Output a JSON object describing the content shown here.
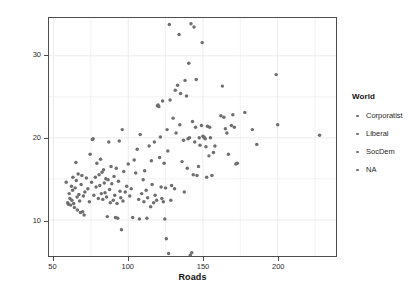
{
  "chart_data": {
    "type": "scatter",
    "title": "",
    "xlabel": "Roads",
    "ylabel": "Donors",
    "xlim": [
      47,
      239
    ],
    "ylim": [
      5.6,
      34.6
    ],
    "xticks": [
      50,
      100,
      150,
      200
    ],
    "yticks": [
      10,
      20,
      30
    ],
    "grid": true,
    "grid_color": "#eaeaea",
    "point_color": "#6e6e6e",
    "point_size": 2.6,
    "legend": {
      "position": "right",
      "title": "World",
      "entries": [
        {
          "label": "Corporatist",
          "marker": "circle",
          "color": "#6e6e6e"
        },
        {
          "label": "Liberal",
          "marker": "circle",
          "color": "#6e6e6e"
        },
        {
          "label": "SocDem",
          "marker": "circle",
          "color": "#6e6e6e"
        },
        {
          "label": "NA",
          "marker": "circle",
          "color": "#6e6e6e"
        }
      ]
    },
    "series": [
      {
        "name": "observations",
        "color": "#6e6e6e",
        "points": [
          [
            58.5,
            14.6
          ],
          [
            59.5,
            12.1
          ],
          [
            60.0,
            11.9
          ],
          [
            60.5,
            13.2
          ],
          [
            61.0,
            12.6
          ],
          [
            61.5,
            11.8
          ],
          [
            62.0,
            14.1
          ],
          [
            62.3,
            12.4
          ],
          [
            62.8,
            13.6
          ],
          [
            63.0,
            15.2
          ],
          [
            63.5,
            12.0
          ],
          [
            64.0,
            11.5
          ],
          [
            64.5,
            13.9
          ],
          [
            65.0,
            17.0
          ],
          [
            65.3,
            14.8
          ],
          [
            65.8,
            12.8
          ],
          [
            66.0,
            11.2
          ],
          [
            66.5,
            15.6
          ],
          [
            67.0,
            13.1
          ],
          [
            67.5,
            12.3
          ],
          [
            68.0,
            10.9
          ],
          [
            68.5,
            14.3
          ],
          [
            69.0,
            15.4
          ],
          [
            69.5,
            11.0
          ],
          [
            70.0,
            12.9
          ],
          [
            70.5,
            10.6
          ],
          [
            71.0,
            13.4
          ],
          [
            72.0,
            15.1
          ],
          [
            73.0,
            13.8
          ],
          [
            74.0,
            12.2
          ],
          [
            74.5,
            18.0
          ],
          [
            75.5,
            14.6
          ],
          [
            76.0,
            19.8
          ],
          [
            76.5,
            19.9
          ],
          [
            77.0,
            13.0
          ],
          [
            78.0,
            15.2
          ],
          [
            78.5,
            14.0
          ],
          [
            79.0,
            16.9
          ],
          [
            80.0,
            12.6
          ],
          [
            80.5,
            15.5
          ],
          [
            81.0,
            14.2
          ],
          [
            81.5,
            17.4
          ],
          [
            82.0,
            13.2
          ],
          [
            82.5,
            15.8
          ],
          [
            83.0,
            12.5
          ],
          [
            83.5,
            16.1
          ],
          [
            84.0,
            14.5
          ],
          [
            84.5,
            13.3
          ],
          [
            85.0,
            15.0
          ],
          [
            85.5,
            12.8
          ],
          [
            86.0,
            10.4
          ],
          [
            86.5,
            14.9
          ],
          [
            87.0,
            19.5
          ],
          [
            87.5,
            13.7
          ],
          [
            88.0,
            12.1
          ],
          [
            88.5,
            16.5
          ],
          [
            89.0,
            14.4
          ],
          [
            90.0,
            12.4
          ],
          [
            90.5,
            15.3
          ],
          [
            91.0,
            13.0
          ],
          [
            91.5,
            10.3
          ],
          [
            92.0,
            16.3
          ],
          [
            92.5,
            12.0
          ],
          [
            93.0,
            10.2
          ],
          [
            93.5,
            14.7
          ],
          [
            94.0,
            19.6
          ],
          [
            94.5,
            13.5
          ],
          [
            95.0,
            12.7
          ],
          [
            95.5,
            8.8
          ],
          [
            96.0,
            21.0
          ],
          [
            96.5,
            12.3
          ],
          [
            97.0,
            15.9
          ],
          [
            98.0,
            13.4
          ],
          [
            99.0,
            14.1
          ],
          [
            100.0,
            16.8
          ],
          [
            101.0,
            12.9
          ],
          [
            102.0,
            13.8
          ],
          [
            103.0,
            10.3
          ],
          [
            104.0,
            17.3
          ],
          [
            105.0,
            15.7
          ],
          [
            106.0,
            18.6
          ],
          [
            107.0,
            12.5
          ],
          [
            107.5,
            10.1
          ],
          [
            108.0,
            20.4
          ],
          [
            109.0,
            13.2
          ],
          [
            110.0,
            14.9
          ],
          [
            110.5,
            12.2
          ],
          [
            111.0,
            16.0
          ],
          [
            112.0,
            13.6
          ],
          [
            112.5,
            10.2
          ],
          [
            113.0,
            12.7
          ],
          [
            114.0,
            19.0
          ],
          [
            115.0,
            11.6
          ],
          [
            115.5,
            17.2
          ],
          [
            116.0,
            14.3
          ],
          [
            117.0,
            12.1
          ],
          [
            117.5,
            19.5
          ],
          [
            118.0,
            13.0
          ],
          [
            119.0,
            12.4
          ],
          [
            119.5,
            23.9
          ],
          [
            120.0,
            24.0
          ],
          [
            120.5,
            23.8
          ],
          [
            121.0,
            17.6
          ],
          [
            121.5,
            20.1
          ],
          [
            122.0,
            14.0
          ],
          [
            122.5,
            12.6
          ],
          [
            123.0,
            24.5
          ],
          [
            123.5,
            12.2
          ],
          [
            124.0,
            16.9
          ],
          [
            124.5,
            10.1
          ],
          [
            125.0,
            13.9
          ],
          [
            125.5,
            7.7
          ],
          [
            126.0,
            21.0
          ],
          [
            126.5,
            18.4
          ],
          [
            127.0,
            5.9
          ],
          [
            127.5,
            33.8
          ],
          [
            128.0,
            24.6
          ],
          [
            128.5,
            12.4
          ],
          [
            129.0,
            14.2
          ],
          [
            130.0,
            22.4
          ],
          [
            131.0,
            13.8
          ],
          [
            131.5,
            25.8
          ],
          [
            132.0,
            20.6
          ],
          [
            133.0,
            26.4
          ],
          [
            134.0,
            32.6
          ],
          [
            134.5,
            21.6
          ],
          [
            135.0,
            25.4
          ],
          [
            136.0,
            17.1
          ],
          [
            137.0,
            19.7
          ],
          [
            137.5,
            13.4
          ],
          [
            138.0,
            27.0
          ],
          [
            139.0,
            25.1
          ],
          [
            139.5,
            16.3
          ],
          [
            140.0,
            19.9
          ],
          [
            140.5,
            29.1
          ],
          [
            141.0,
            20.0
          ],
          [
            141.5,
            5.7
          ],
          [
            142.0,
            33.9
          ],
          [
            142.5,
            6.0
          ],
          [
            143.0,
            22.0
          ],
          [
            143.5,
            15.5
          ],
          [
            144.0,
            33.5
          ],
          [
            144.5,
            19.5
          ],
          [
            145.0,
            21.3
          ],
          [
            145.5,
            27.1
          ],
          [
            146.0,
            15.4
          ],
          [
            147.0,
            16.5
          ],
          [
            147.5,
            20.0
          ],
          [
            148.0,
            19.1
          ],
          [
            149.0,
            21.5
          ],
          [
            149.5,
            31.6
          ],
          [
            150.0,
            20.2
          ],
          [
            150.5,
            20.1
          ],
          [
            151.0,
            20.0
          ],
          [
            151.5,
            19.9
          ],
          [
            152.0,
            18.9
          ],
          [
            152.5,
            15.2
          ],
          [
            153.0,
            21.4
          ],
          [
            154.0,
            17.8
          ],
          [
            154.5,
            21.3
          ],
          [
            155.0,
            20.0
          ],
          [
            156.0,
            15.4
          ],
          [
            157.0,
            18.2
          ],
          [
            158.0,
            19.0
          ],
          [
            162.0,
            22.7
          ],
          [
            163.0,
            26.3
          ],
          [
            164.0,
            22.5
          ],
          [
            165.0,
            21.1
          ],
          [
            166.0,
            20.6
          ],
          [
            167.0,
            18.0
          ],
          [
            169.0,
            21.5
          ],
          [
            170.0,
            22.8
          ],
          [
            171.0,
            21.3
          ],
          [
            172.0,
            16.8
          ],
          [
            173.0,
            16.9
          ],
          [
            178.0,
            23.1
          ],
          [
            183.0,
            21.0
          ],
          [
            186.0,
            19.2
          ],
          [
            199.0,
            27.7
          ],
          [
            200.0,
            21.6
          ],
          [
            228.0,
            20.3
          ]
        ]
      }
    ]
  },
  "axes": {
    "x": {
      "title": "Roads",
      "tick_labels": [
        "50",
        "100",
        "150",
        "200"
      ]
    },
    "y": {
      "title": "Donors",
      "tick_labels": [
        "10",
        "20",
        "30"
      ]
    }
  },
  "legend": {
    "title": "World",
    "items": [
      {
        "label": "Corporatist"
      },
      {
        "label": "Liberal"
      },
      {
        "label": "SocDem"
      },
      {
        "label": "NA"
      }
    ]
  }
}
